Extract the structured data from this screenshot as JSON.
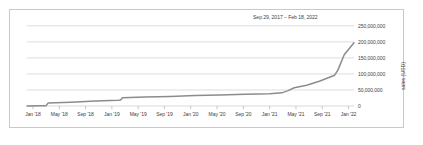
{
  "chart_data": {
    "type": "line",
    "title": "Sep 29, 2017 – Feb 18, 2022",
    "xlabel": "",
    "ylabel": "sales (USD)",
    "grid": true,
    "legend": false,
    "ylim": [
      0,
      262000000
    ],
    "yticks": [
      0,
      50000000,
      100000000,
      150000000,
      200000000,
      250000000
    ],
    "ytick_labels": [
      "0",
      "50,000,000",
      "100,000,000",
      "150,000,000",
      "200,000,000",
      "250,000,000"
    ],
    "xtick_labels": [
      "Jan '18",
      "May '18",
      "Sep '18",
      "Jan '19",
      "May '19",
      "Sep '19",
      "Jan '20",
      "May '20",
      "Sep '20",
      "Jan '21",
      "May '21",
      "Sep '21",
      "Jan '22"
    ],
    "line_color": "#8c8c8c",
    "grid_color": "#cfcfcf",
    "x": [
      "2017-09-29",
      "2017-12-01",
      "2018-01-01",
      "2018-01-10",
      "2018-05-01",
      "2018-09-01",
      "2018-12-20",
      "2019-01-01",
      "2019-01-10",
      "2019-05-01",
      "2019-09-01",
      "2020-01-01",
      "2020-05-01",
      "2020-09-01",
      "2021-01-01",
      "2021-03-01",
      "2021-04-01",
      "2021-05-01",
      "2021-07-01",
      "2021-09-01",
      "2021-10-15",
      "2021-11-15",
      "2021-12-01",
      "2022-01-01",
      "2022-02-18"
    ],
    "values": [
      0,
      500000,
      1000000,
      9000000,
      12000000,
      15500000,
      18000000,
      19000000,
      26000000,
      28000000,
      30000000,
      32500000,
      34500000,
      36500000,
      38500000,
      41000000,
      48000000,
      57000000,
      65000000,
      77000000,
      88000000,
      96000000,
      112000000,
      160000000,
      197000000
    ],
    "series": [
      {
        "name": "cumulative sales",
        "values": [
          0,
          500000,
          1000000,
          9000000,
          12000000,
          15500000,
          18000000,
          19000000,
          26000000,
          28000000,
          30000000,
          32500000,
          34500000,
          36500000,
          38500000,
          41000000,
          48000000,
          57000000,
          65000000,
          77000000,
          88000000,
          96000000,
          112000000,
          160000000,
          197000000
        ]
      }
    ]
  }
}
